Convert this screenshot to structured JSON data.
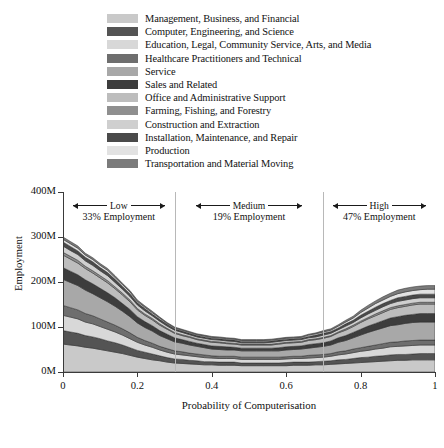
{
  "legend": {
    "position": "top",
    "items": [
      {
        "label": "Management, Business, and Financial",
        "color": "#c9c9c9"
      },
      {
        "label": "Computer, Engineering, and Science",
        "color": "#545454"
      },
      {
        "label": "Education, Legal, Community Service, Arts, and Media",
        "color": "#d8d8d8"
      },
      {
        "label": "Healthcare Practitioners and Technical",
        "color": "#6e6e6e"
      },
      {
        "label": "Service",
        "color": "#a8a8a8"
      },
      {
        "label": "Sales and Related",
        "color": "#3d3d3d"
      },
      {
        "label": "Office and Administrative Support",
        "color": "#bdbdbd"
      },
      {
        "label": "Farming, Fishing, and Forestry",
        "color": "#8f8f8f"
      },
      {
        "label": "Construction and Extraction",
        "color": "#cfcfcf"
      },
      {
        "label": "Installation, Maintenance, and Repair",
        "color": "#4a4a4a"
      },
      {
        "label": "Production",
        "color": "#e2e2e2"
      },
      {
        "label": "Transportation and Material Moving",
        "color": "#7b7b7b"
      }
    ]
  },
  "annotations": [
    {
      "name": "Low",
      "employment": "33% Employment",
      "x_start": 0.0,
      "x_end": 0.3
    },
    {
      "name": "Medium",
      "employment": "19% Employment",
      "x_start": 0.3,
      "x_end": 0.7
    },
    {
      "name": "High",
      "employment": "47% Employment",
      "x_start": 0.7,
      "x_end": 1.0
    }
  ],
  "chart_data": {
    "type": "area",
    "title": "",
    "subtitle": "",
    "xlabel": "Probability of Computerisation",
    "ylabel": "Employment",
    "xlim": [
      0,
      1
    ],
    "ylim": [
      0,
      400000000
    ],
    "xticks": [
      0,
      0.2,
      0.4,
      0.6,
      0.8,
      1
    ],
    "xtick_labels": [
      "0",
      "0.2",
      "0.4",
      "0.6",
      "0.8",
      "1"
    ],
    "yticks": [
      0,
      100000000,
      200000000,
      300000000,
      400000000
    ],
    "ytick_labels": [
      "0M",
      "100M",
      "200M",
      "300M",
      "400M"
    ],
    "grid": false,
    "stacked": true,
    "note": "Cumulative employment remaining above each probability threshold, stacked by occupation group.",
    "x": [
      0.0,
      0.02,
      0.04,
      0.06,
      0.08,
      0.1,
      0.12,
      0.14,
      0.16,
      0.18,
      0.2,
      0.22,
      0.24,
      0.26,
      0.28,
      0.3,
      0.32,
      0.34,
      0.36,
      0.38,
      0.4,
      0.42,
      0.44,
      0.46,
      0.48,
      0.5,
      0.52,
      0.54,
      0.56,
      0.58,
      0.6,
      0.62,
      0.64,
      0.66,
      0.68,
      0.7,
      0.72,
      0.74,
      0.76,
      0.78,
      0.8,
      0.82,
      0.84,
      0.86,
      0.88,
      0.9,
      0.92,
      0.94,
      0.96,
      0.98,
      1.0
    ],
    "total": [
      300,
      287,
      275,
      262,
      250,
      238,
      225,
      210,
      196,
      178,
      160,
      146,
      133,
      120,
      108,
      97,
      90,
      85,
      80,
      76,
      73,
      71,
      69,
      68,
      67,
      66,
      66,
      66,
      67,
      68,
      70,
      72,
      74,
      77,
      80,
      84,
      90,
      98,
      108,
      120,
      133,
      146,
      158,
      168,
      176,
      182,
      186,
      189,
      190,
      191,
      192
    ],
    "series": [
      {
        "name": "Management, Business, and Financial",
        "color": "#c9c9c9",
        "values": [
          62,
          60,
          58,
          55,
          53,
          50,
          47,
          44,
          41,
          37,
          33,
          30,
          27,
          25,
          22,
          20,
          19,
          18,
          17,
          16,
          16,
          15,
          15,
          15,
          14,
          14,
          14,
          14,
          14,
          14,
          14,
          15,
          15,
          15,
          16,
          16,
          17,
          18,
          19,
          20,
          21,
          22,
          23,
          24,
          25,
          26,
          26,
          27,
          27,
          27,
          27
        ]
      },
      {
        "name": "Computer, Engineering, and Science",
        "color": "#545454",
        "values": [
          30,
          29,
          28,
          26,
          25,
          24,
          22,
          21,
          19,
          17,
          15,
          14,
          13,
          11,
          10,
          9,
          9,
          8,
          8,
          7,
          7,
          7,
          7,
          7,
          6,
          6,
          6,
          6,
          6,
          6,
          7,
          7,
          7,
          7,
          7,
          8,
          8,
          9,
          9,
          10,
          11,
          11,
          12,
          12,
          13,
          13,
          13,
          13,
          14,
          14,
          14
        ]
      },
      {
        "name": "Education, Legal, Community Service, Arts, and Media",
        "color": "#d8d8d8",
        "values": [
          34,
          33,
          32,
          30,
          29,
          27,
          26,
          24,
          22,
          20,
          18,
          16,
          15,
          13,
          12,
          11,
          10,
          10,
          9,
          9,
          8,
          8,
          8,
          8,
          8,
          8,
          8,
          8,
          8,
          8,
          8,
          8,
          8,
          9,
          9,
          9,
          10,
          11,
          12,
          13,
          14,
          15,
          16,
          17,
          18,
          18,
          19,
          19,
          19,
          19,
          19
        ]
      },
      {
        "name": "Healthcare Practitioners and Technical",
        "color": "#6e6e6e",
        "values": [
          22,
          21,
          20,
          19,
          18,
          17,
          16,
          15,
          14,
          13,
          11,
          10,
          9,
          8,
          8,
          7,
          7,
          6,
          6,
          6,
          5,
          5,
          5,
          5,
          5,
          5,
          5,
          5,
          5,
          5,
          5,
          5,
          5,
          6,
          6,
          6,
          6,
          7,
          7,
          8,
          8,
          9,
          9,
          10,
          10,
          10,
          11,
          11,
          11,
          11,
          11
        ]
      },
      {
        "name": "Service",
        "color": "#a8a8a8",
        "values": [
          58,
          56,
          54,
          52,
          49,
          47,
          45,
          42,
          39,
          36,
          32,
          29,
          27,
          24,
          22,
          20,
          19,
          18,
          17,
          16,
          15,
          15,
          14,
          14,
          14,
          14,
          14,
          14,
          14,
          14,
          15,
          15,
          16,
          16,
          17,
          18,
          19,
          21,
          23,
          25,
          28,
          31,
          33,
          35,
          37,
          38,
          39,
          40,
          40,
          40,
          40
        ]
      },
      {
        "name": "Sales and Related",
        "color": "#3d3d3d",
        "values": [
          26,
          25,
          24,
          23,
          22,
          21,
          20,
          19,
          17,
          16,
          14,
          13,
          12,
          11,
          10,
          9,
          8,
          8,
          7,
          7,
          7,
          7,
          7,
          6,
          6,
          6,
          6,
          6,
          6,
          7,
          7,
          7,
          7,
          8,
          8,
          8,
          9,
          10,
          11,
          12,
          13,
          14,
          15,
          16,
          17,
          18,
          18,
          18,
          19,
          19,
          19
        ]
      },
      {
        "name": "Office and Administrative Support",
        "color": "#bdbdbd",
        "values": [
          28,
          27,
          26,
          25,
          24,
          23,
          22,
          20,
          19,
          17,
          15,
          14,
          13,
          12,
          11,
          10,
          9,
          9,
          8,
          8,
          8,
          8,
          7,
          7,
          7,
          7,
          7,
          7,
          7,
          8,
          8,
          8,
          8,
          9,
          9,
          10,
          10,
          11,
          12,
          13,
          15,
          16,
          17,
          18,
          19,
          20,
          20,
          21,
          21,
          21,
          21
        ]
      },
      {
        "name": "Farming, Fishing, and Forestry",
        "color": "#8f8f8f",
        "values": [
          6,
          6,
          6,
          5,
          5,
          5,
          5,
          4,
          4,
          4,
          3,
          3,
          3,
          3,
          2,
          2,
          2,
          2,
          2,
          2,
          2,
          2,
          2,
          2,
          2,
          2,
          2,
          2,
          2,
          2,
          2,
          2,
          2,
          2,
          2,
          2,
          2,
          2,
          3,
          3,
          3,
          3,
          4,
          4,
          4,
          4,
          4,
          4,
          4,
          4,
          4
        ]
      },
      {
        "name": "Construction and Extraction",
        "color": "#cfcfcf",
        "values": [
          14,
          13,
          13,
          12,
          12,
          11,
          11,
          10,
          9,
          8,
          8,
          7,
          6,
          6,
          5,
          5,
          5,
          4,
          4,
          4,
          4,
          4,
          4,
          4,
          3,
          3,
          3,
          3,
          4,
          4,
          4,
          4,
          4,
          4,
          4,
          5,
          5,
          5,
          6,
          6,
          7,
          8,
          8,
          9,
          9,
          10,
          10,
          10,
          10,
          10,
          10
        ]
      },
      {
        "name": "Installation, Maintenance, and Repair",
        "color": "#4a4a4a",
        "values": [
          9,
          9,
          8,
          8,
          8,
          7,
          7,
          7,
          6,
          6,
          5,
          5,
          4,
          4,
          4,
          3,
          3,
          3,
          3,
          3,
          3,
          3,
          3,
          3,
          3,
          3,
          3,
          3,
          3,
          3,
          3,
          3,
          3,
          3,
          4,
          4,
          4,
          4,
          5,
          5,
          6,
          6,
          7,
          7,
          7,
          8,
          8,
          8,
          8,
          8,
          8
        ]
      },
      {
        "name": "Production",
        "color": "#e2e2e2",
        "values": [
          6,
          6,
          6,
          5,
          5,
          5,
          5,
          4,
          4,
          4,
          3,
          3,
          3,
          3,
          2,
          2,
          2,
          2,
          2,
          2,
          2,
          2,
          2,
          2,
          2,
          2,
          2,
          2,
          2,
          2,
          2,
          2,
          2,
          3,
          3,
          3,
          3,
          4,
          4,
          5,
          6,
          7,
          8,
          8,
          9,
          9,
          10,
          10,
          10,
          11,
          11
        ]
      },
      {
        "name": "Transportation and Material Moving",
        "color": "#7b7b7b",
        "values": [
          5,
          5,
          5,
          4,
          4,
          4,
          4,
          4,
          3,
          3,
          3,
          3,
          3,
          2,
          2,
          2,
          2,
          2,
          2,
          2,
          2,
          2,
          2,
          2,
          2,
          2,
          2,
          2,
          2,
          2,
          2,
          2,
          2,
          2,
          2,
          3,
          3,
          3,
          4,
          4,
          5,
          6,
          6,
          7,
          7,
          8,
          8,
          8,
          8,
          8,
          8
        ]
      }
    ]
  }
}
